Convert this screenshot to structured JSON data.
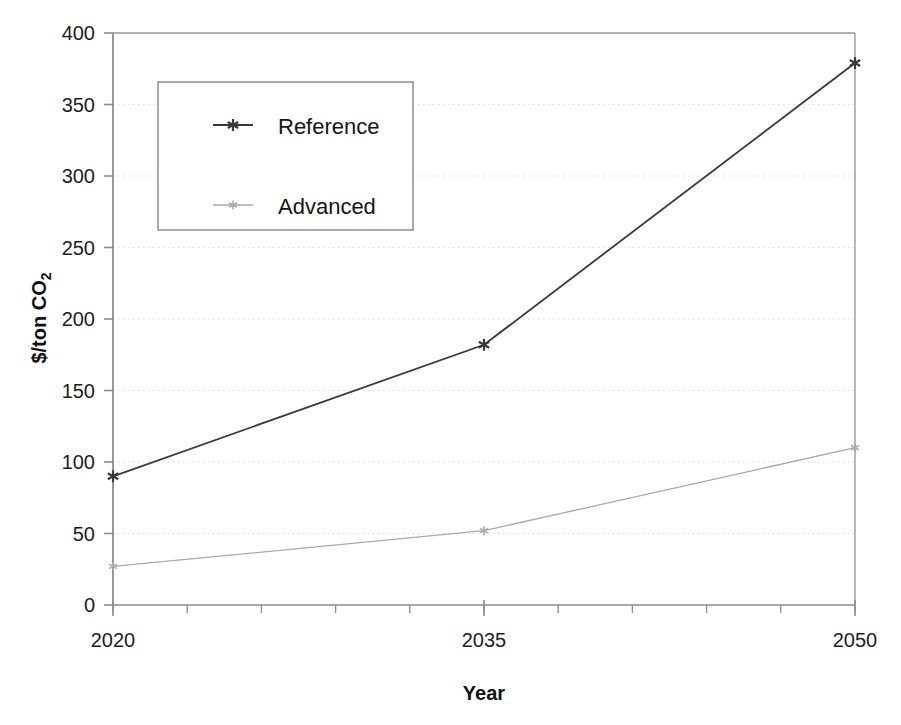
{
  "chart_data": {
    "type": "line",
    "title": "",
    "xlabel": "Year",
    "ylabel": "$/ton CO2",
    "ylabel_parts": {
      "main": "$/ton CO",
      "subscript": "2"
    },
    "categories": [
      "2020",
      "2035",
      "2050"
    ],
    "x": [
      2020,
      2035,
      2050
    ],
    "series": [
      {
        "name": "Reference",
        "values": [
          90,
          182,
          379
        ],
        "color": "#3a3a3a",
        "marker": "star"
      },
      {
        "name": "Advanced",
        "values": [
          27,
          52,
          110
        ],
        "color": "#aaaaaa",
        "marker": "star"
      }
    ],
    "ylim": [
      0,
      400
    ],
    "xlim": [
      2020,
      2050
    ],
    "yticks": [
      "0",
      "50",
      "100",
      "150",
      "200",
      "250",
      "300",
      "350",
      "400"
    ],
    "ytick_values": [
      0,
      50,
      100,
      150,
      200,
      250,
      300,
      350,
      400
    ],
    "xticks": [
      "2020",
      "2035",
      "2050"
    ],
    "xminor_tick_count": 10,
    "grid": "horizontal-dotted",
    "grid_color": "#d9d9d9",
    "legend_position": "upper-left-inside",
    "plot_border": true,
    "axis_color": "#8c8c8c"
  },
  "axes": {
    "x_title": "Year",
    "y_title_main": "$/ton CO",
    "y_title_sub": "2"
  },
  "legend": {
    "entries": [
      {
        "label": "Reference"
      },
      {
        "label": "Advanced"
      }
    ]
  },
  "ticks": {
    "y": [
      "400",
      "350",
      "300",
      "250",
      "200",
      "150",
      "100",
      "50",
      "0"
    ],
    "x": [
      "2020",
      "2035",
      "2050"
    ]
  }
}
